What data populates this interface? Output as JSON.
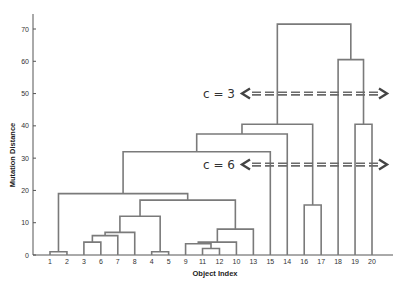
{
  "chart_data": {
    "type": "dendrogram",
    "title": "",
    "xlabel": "Object Index",
    "ylabel": "Mutation Distance",
    "ylim": [
      0,
      75
    ],
    "yticks": [
      0,
      10,
      20,
      30,
      40,
      50,
      60,
      70
    ],
    "leaf_order": [
      "1",
      "2",
      "3",
      "6",
      "7",
      "8",
      "4",
      "5",
      "9",
      "11",
      "12",
      "10",
      "13",
      "15",
      "14",
      "16",
      "17",
      "18",
      "19",
      "20"
    ],
    "merges": [
      {
        "id": "a",
        "left": "1",
        "right": "2",
        "height": 1
      },
      {
        "id": "b",
        "left": "3",
        "right": "6",
        "height": 4
      },
      {
        "id": "c",
        "left": "b",
        "right": "7",
        "height": 6
      },
      {
        "id": "d",
        "left": "c",
        "right": "8",
        "height": 7
      },
      {
        "id": "e",
        "left": "4",
        "right": "5",
        "height": 1
      },
      {
        "id": "f",
        "left": "d",
        "right": "e",
        "height": 12
      },
      {
        "id": "g",
        "left": "11",
        "right": "12",
        "height": 2
      },
      {
        "id": "h",
        "left": "9",
        "right": "g",
        "height": 3.5
      },
      {
        "id": "i",
        "left": "h",
        "right": "10",
        "height": 4
      },
      {
        "id": "j",
        "left": "i",
        "right": "13",
        "height": 8
      },
      {
        "id": "k",
        "left": "f",
        "right": "j",
        "height": 17
      },
      {
        "id": "l",
        "left": "a",
        "right": "k",
        "height": 19
      },
      {
        "id": "m",
        "left": "l",
        "right": "15",
        "height": 32
      },
      {
        "id": "n",
        "left": "m",
        "right": "14",
        "height": 37.5
      },
      {
        "id": "o",
        "left": "16",
        "right": "17",
        "height": 15.5
      },
      {
        "id": "p",
        "left": "n",
        "right": "o",
        "height": 40.5
      },
      {
        "id": "q",
        "left": "19",
        "right": "20",
        "height": 40.5
      },
      {
        "id": "r",
        "left": "18",
        "right": "q",
        "height": 60.5
      },
      {
        "id": "s",
        "left": "p",
        "right": "r",
        "height": 71.5
      }
    ],
    "annotations": [
      {
        "label": "c = 3",
        "height": 50,
        "style": "dashed-double-arrow"
      },
      {
        "label": "c = 6",
        "height": 28,
        "style": "dashed-double-arrow"
      }
    ],
    "grid": false,
    "legend": null
  },
  "colors": {
    "tree_line": "#7a7a7a",
    "axis": "#555555",
    "cut_line": "#6a6a6a",
    "arrow": "#444444"
  }
}
